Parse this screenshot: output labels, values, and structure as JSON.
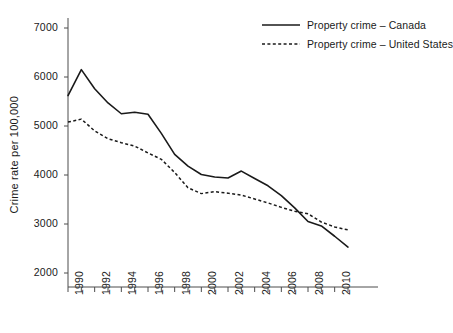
{
  "chart_data": {
    "type": "line",
    "title": "",
    "xlabel": "",
    "ylabel": "Crime rate per 100,000",
    "xlim": [
      1990,
      2011
    ],
    "ylim": [
      2000,
      7000
    ],
    "grid": false,
    "legend_position": "top-right",
    "x": [
      1990,
      1991,
      1992,
      1993,
      1994,
      1995,
      1996,
      1997,
      1998,
      1999,
      2000,
      2001,
      2002,
      2003,
      2004,
      2005,
      2006,
      2007,
      2008,
      2009,
      2010,
      2011
    ],
    "xtick_labels": [
      "1990",
      "1992",
      "1994",
      "1996",
      "1998",
      "2000",
      "2002",
      "2004",
      "2006",
      "2008",
      "2010"
    ],
    "xtick_values": [
      1990,
      1992,
      1994,
      1996,
      1998,
      2000,
      2002,
      2004,
      2006,
      2008,
      2010
    ],
    "ytick_labels": [
      "2000",
      "3000",
      "4000",
      "5000",
      "6000",
      "7000"
    ],
    "ytick_values": [
      2000,
      3000,
      4000,
      5000,
      6000,
      7000
    ],
    "series": [
      {
        "name": "Property crime – Canada",
        "style": "solid",
        "color": "#1a1a1a",
        "values": [
          5620,
          6150,
          5760,
          5470,
          5250,
          5280,
          5240,
          4850,
          4420,
          4180,
          4010,
          3960,
          3940,
          4080,
          3930,
          3780,
          3580,
          3330,
          3050,
          2960,
          2750,
          2530
        ]
      },
      {
        "name": "Property crime – United States",
        "style": "dashed",
        "color": "#1a1a1a",
        "values": [
          5080,
          5140,
          4900,
          4740,
          4660,
          4590,
          4450,
          4320,
          4050,
          3740,
          3620,
          3660,
          3630,
          3590,
          3510,
          3430,
          3340,
          3260,
          3210,
          3040,
          2940,
          2880
        ]
      }
    ],
    "legend": [
      {
        "label": "Property crime – Canada",
        "style": "solid"
      },
      {
        "label": "Property crime – United States",
        "style": "dashed"
      }
    ]
  }
}
